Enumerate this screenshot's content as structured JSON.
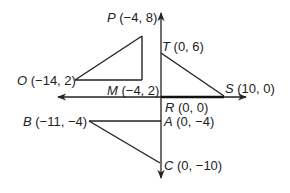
{
  "diagram": {
    "type": "coordinate-geometry",
    "axes": {
      "x_axis": {
        "direction": "both",
        "arrows": true
      },
      "y_axis": {
        "direction": "both",
        "arrows": true
      }
    },
    "points": [
      {
        "id": "P",
        "letter": "P",
        "coords": " (−4, 8)",
        "x": -4,
        "y": 8
      },
      {
        "id": "T",
        "letter": "T",
        "coords": " (0, 6)",
        "x": 0,
        "y": 6
      },
      {
        "id": "O",
        "letter": "O",
        "coords": " (−14, 2)",
        "x": -14,
        "y": 2
      },
      {
        "id": "M",
        "letter": "M",
        "coords": " (−4, 2)",
        "x": -4,
        "y": 2
      },
      {
        "id": "S",
        "letter": "S",
        "coords": " (10, 0)",
        "x": 10,
        "y": 0
      },
      {
        "id": "R",
        "letter": "R",
        "coords": " (0, 0)",
        "x": 0,
        "y": 0
      },
      {
        "id": "B",
        "letter": "B",
        "coords": " (−11, −4)",
        "x": -11,
        "y": -4
      },
      {
        "id": "A",
        "letter": "A",
        "coords": " (0, −4)",
        "x": 0,
        "y": -4
      },
      {
        "id": "C",
        "letter": "C",
        "coords": " (0, −10)",
        "x": 0,
        "y": -10
      }
    ],
    "triangles": [
      {
        "name": "OPM",
        "vertices": [
          "O",
          "P",
          "M"
        ]
      },
      {
        "name": "RTS",
        "vertices": [
          "R",
          "T",
          "S"
        ]
      },
      {
        "name": "BAC",
        "vertices": [
          "B",
          "A",
          "C"
        ]
      }
    ],
    "colors": {
      "ink": "#222222",
      "background": "#ffffff"
    }
  }
}
